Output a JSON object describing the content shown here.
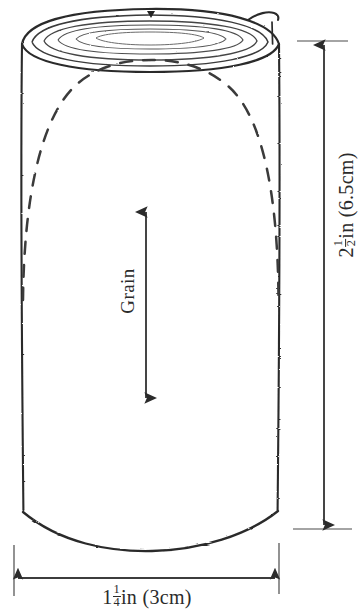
{
  "figure": {
    "ink_color": "#2b2b2b",
    "dash_color": "#3a3a3a",
    "background": "#ffffff"
  },
  "annotations": {
    "grain": {
      "label": "Grain",
      "arrow": "double-headed-vertical-arrow"
    },
    "width": {
      "whole": "1",
      "numerator": "1",
      "denominator": "4",
      "unit": "in",
      "metric": "(3cm)"
    },
    "height": {
      "whole": "2",
      "numerator": "1",
      "denominator": "2",
      "unit": "in",
      "metric": "(6.5cm)"
    }
  }
}
